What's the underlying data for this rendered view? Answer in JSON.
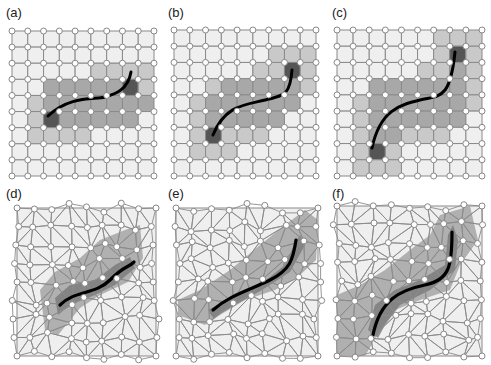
{
  "figure": {
    "panels": [
      {
        "id": "a",
        "label": "(a)",
        "type": "structured-grid",
        "label_pos": [
          6,
          6
        ],
        "origin": [
          12,
          31
        ],
        "size": [
          142,
          145
        ],
        "cells": 9,
        "shade": [
          "000000000",
          "000000000",
          "000001111",
          "002222231",
          "012222222",
          "013222220",
          "011110000",
          "000000000",
          "000000000"
        ],
        "curve": "M 48 116 C 70 95, 95 100, 105 97 S 128 90, 131 72"
      },
      {
        "id": "b",
        "label": "(b)",
        "type": "structured-grid",
        "label_pos": [
          168,
          6
        ],
        "origin": [
          174,
          30
        ],
        "size": [
          142,
          146
        ],
        "cells": 9,
        "shade": [
          "000000000",
          "000000111",
          "000001131",
          "001222221",
          "012222220",
          "012222200",
          "013111000",
          "011100000",
          "000000000"
        ],
        "curve": "M 213 135 C 225 105, 245 105, 265 100 S 290 95, 292 70"
      },
      {
        "id": "c",
        "label": "(c)",
        "type": "structured-grid",
        "label_pos": [
          332,
          6
        ],
        "origin": [
          337,
          30
        ],
        "size": [
          145,
          146
        ],
        "cells": 9,
        "shade": [
          "000000111",
          "000000131",
          "000001121",
          "002222221",
          "012222221",
          "012222220",
          "012211100",
          "013100000",
          "011100000"
        ],
        "curve": "M 372 148 C 380 110, 400 105, 420 100 S 450 100, 455 52"
      },
      {
        "id": "d",
        "label": "(d)",
        "type": "unstructured-mesh",
        "label_pos": [
          6,
          188
        ],
        "origin": [
          17,
          208
        ],
        "size": [
          139,
          148
        ],
        "region": "M 40 290 L 55 272 L 80 258 L 100 240 L 125 230 L 140 225 L 143 258 L 128 282 L 100 295 L 80 308 L 58 335 L 45 330 Z",
        "inner": "M 55 298 L 70 285 L 95 280 L 115 265 L 130 257 L 135 268 L 115 285 L 95 295 L 70 305 L 58 315 Z",
        "curve": "M 60 305 C 75 290, 95 295, 110 280 S 128 268, 134 262"
      },
      {
        "id": "e",
        "label": "(e)",
        "type": "unstructured-mesh",
        "label_pos": [
          168,
          188
        ],
        "origin": [
          176,
          208
        ],
        "size": [
          142,
          148
        ],
        "region": "M 178 300 L 200 290 L 230 270 L 260 245 L 285 225 L 305 210 L 318 220 L 316 260 L 300 275 L 275 290 L 245 300 L 220 315 L 205 325 L 178 315 Z",
        "inner": "M 208 310 L 230 298 L 260 285 L 285 265 L 295 243 L 300 235 L 305 245 L 290 272 L 262 290 L 235 305 L 213 318 Z",
        "curve": "M 213 310 C 230 295, 250 290, 270 280 S 293 260, 296 240"
      },
      {
        "id": "f",
        "label": "(f)",
        "type": "unstructured-mesh",
        "label_pos": [
          332,
          188
        ],
        "origin": [
          337,
          206
        ],
        "size": [
          145,
          150
        ],
        "region": "M 337 295 L 360 285 L 385 270 L 410 250 L 430 235 L 440 215 L 470 206 L 478 240 L 460 265 L 450 290 L 420 300 L 395 310 L 380 330 L 365 356 L 337 356 Z",
        "inner": "M 368 330 L 375 305 L 395 290 L 420 280 L 445 265 L 448 235 L 453 225 L 458 240 L 455 270 L 430 290 L 400 305 L 385 325 L 378 338 Z",
        "curve": "M 373 335 C 380 300, 400 290, 425 285 S 452 265, 452 232"
      }
    ],
    "colors": {
      "light": "#efefef",
      "medium_light": "#c9c9c9",
      "medium": "#a8a8a8",
      "dark": "#555555",
      "grid_line": "#8a8a8a",
      "node_fill": "#ffffff",
      "node_stroke": "#888888",
      "curve": "#000000"
    }
  }
}
